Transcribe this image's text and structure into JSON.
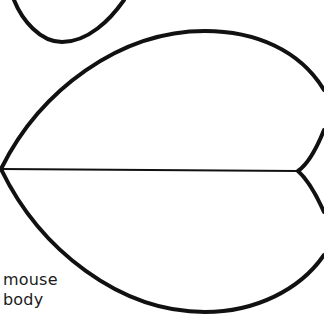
{
  "diagram": {
    "title": "",
    "stroke_color": "#111111",
    "background": "#ffffff",
    "shapes": [
      {
        "id": "small-shape-partial",
        "description": "partial rounded heart/leaf shape at top edge"
      },
      {
        "id": "mouse-body",
        "description": "large heart-shaped outline with horizontal center line ending at notch"
      }
    ]
  },
  "label": {
    "line1": "mouse",
    "line2": "body"
  }
}
